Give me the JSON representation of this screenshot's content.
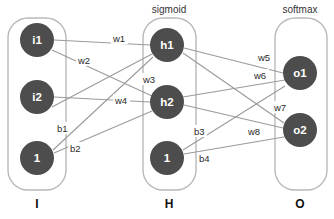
{
  "diagram": {
    "title_colors": {
      "node_fill": "#4d4d4d",
      "node_text": "#ffffff",
      "edge_stroke": "#9a9a9a",
      "box_stroke": "#b9b9b9",
      "background": "#ffffff"
    },
    "layers": [
      {
        "id": "input",
        "activation": "",
        "footer": "I",
        "box": {
          "x": 8,
          "y": 18,
          "w": 58,
          "h": 172,
          "r": 20
        },
        "footer_pos": {
          "x": 37,
          "y": 204
        },
        "nodes": [
          {
            "id": "i1",
            "label": "i1",
            "cx": 37,
            "cy": 40,
            "r": 17
          },
          {
            "id": "i2",
            "label": "i2",
            "cx": 37,
            "cy": 97,
            "r": 17
          },
          {
            "id": "ibias",
            "label": "1",
            "cx": 37,
            "cy": 158,
            "r": 17
          }
        ]
      },
      {
        "id": "hidden",
        "activation": "sigmoid",
        "activation_pos": {
          "x": 169,
          "y": 9
        },
        "footer": "H",
        "box": {
          "x": 143,
          "y": 18,
          "w": 53,
          "h": 172,
          "r": 20
        },
        "footer_pos": {
          "x": 169,
          "y": 204
        },
        "nodes": [
          {
            "id": "h1",
            "label": "h1",
            "cx": 167,
            "cy": 45,
            "r": 17
          },
          {
            "id": "h2",
            "label": "h2",
            "cx": 167,
            "cy": 102,
            "r": 17
          },
          {
            "id": "hbias",
            "label": "1",
            "cx": 167,
            "cy": 158,
            "r": 17
          }
        ]
      },
      {
        "id": "output",
        "activation": "softmax",
        "activation_pos": {
          "x": 300,
          "y": 9
        },
        "footer": "O",
        "box": {
          "x": 275,
          "y": 18,
          "w": 52,
          "h": 172,
          "r": 20
        },
        "footer_pos": {
          "x": 300,
          "y": 204
        },
        "nodes": [
          {
            "id": "o1",
            "label": "o1",
            "cx": 300,
            "cy": 73,
            "r": 17
          },
          {
            "id": "o2",
            "label": "o2",
            "cx": 300,
            "cy": 130,
            "r": 17
          }
        ]
      }
    ],
    "edges": [
      {
        "id": "w1",
        "from": "i1",
        "to": "h1",
        "label": "w1",
        "x1": 54,
        "y1": 40,
        "x2": 150,
        "y2": 45,
        "lx": 113,
        "ly": 38
      },
      {
        "id": "w2",
        "from": "i1",
        "to": "h2",
        "label": "w2",
        "x1": 52,
        "y1": 50,
        "x2": 152,
        "y2": 96,
        "lx": 78,
        "ly": 60
      },
      {
        "id": "w3",
        "from": "i2",
        "to": "h1",
        "label": "w3",
        "x1": 52,
        "y1": 107,
        "x2": 152,
        "y2": 54,
        "lx": 143,
        "ly": 79
      },
      {
        "id": "w4",
        "from": "i2",
        "to": "h2",
        "label": "w4",
        "x1": 54,
        "y1": 97,
        "x2": 150,
        "y2": 102,
        "lx": 115,
        "ly": 100
      },
      {
        "id": "b1",
        "from": "ibias",
        "to": "h1",
        "label": "b1",
        "x1": 53,
        "y1": 150,
        "x2": 153,
        "y2": 57,
        "lx": 57,
        "ly": 128
      },
      {
        "id": "b2",
        "from": "ibias",
        "to": "h2",
        "label": "b2",
        "x1": 54,
        "y1": 153,
        "x2": 152,
        "y2": 111,
        "lx": 70,
        "ly": 148
      },
      {
        "id": "w5",
        "from": "h1",
        "to": "o1",
        "label": "w5",
        "x1": 184,
        "y1": 48,
        "x2": 283,
        "y2": 73,
        "lx": 258,
        "ly": 57
      },
      {
        "id": "w6",
        "from": "h1",
        "to": "o2",
        "label": "w6",
        "x1": 183,
        "y1": 53,
        "x2": 284,
        "y2": 123,
        "lx": 254,
        "ly": 75
      },
      {
        "id": "w7",
        "from": "h2",
        "to": "o1",
        "label": "w7",
        "x1": 183,
        "y1": 97,
        "x2": 285,
        "y2": 80,
        "lx": 274,
        "ly": 107
      },
      {
        "id": "w8",
        "from": "h2",
        "to": "o2",
        "label": "w8",
        "x1": 184,
        "y1": 105,
        "x2": 283,
        "y2": 128,
        "lx": 248,
        "ly": 131
      },
      {
        "id": "b3",
        "from": "hbias",
        "to": "o1",
        "label": "b3",
        "x1": 183,
        "y1": 150,
        "x2": 285,
        "y2": 86,
        "lx": 194,
        "ly": 131
      },
      {
        "id": "b4",
        "from": "hbias",
        "to": "o2",
        "label": "b4",
        "x1": 184,
        "y1": 154,
        "x2": 284,
        "y2": 137,
        "lx": 199,
        "ly": 158
      }
    ]
  }
}
